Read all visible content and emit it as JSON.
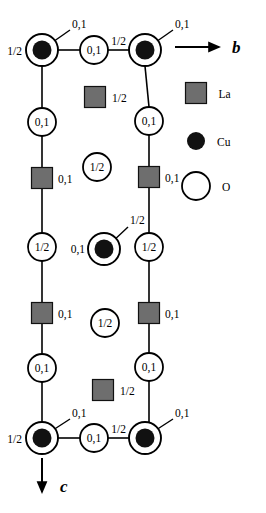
{
  "figure": {
    "colors": {
      "la_fill": "#6e6e6e",
      "cu_fill": "#111111",
      "o_fill": "#ffffff",
      "stroke": "#000000",
      "background": "#ffffff"
    }
  },
  "axes": [
    {
      "name": "b-axis",
      "label": "b",
      "direction": "right",
      "x1": 175,
      "y1": 47,
      "x2": 219,
      "y2": 47,
      "label_x": 232,
      "label_y": 53
    },
    {
      "name": "c-axis",
      "label": "c",
      "direction": "down",
      "x1": 42,
      "y1": 458,
      "x2": 42,
      "y2": 492,
      "label_x": 60,
      "label_y": 492
    }
  ],
  "legend": {
    "items": [
      {
        "symbol": "square",
        "label": "La",
        "x": 196,
        "y": 93,
        "size": 21
      },
      {
        "symbol": "filled-circle",
        "label": "Cu",
        "x": 196,
        "y": 141,
        "r": 9
      },
      {
        "symbol": "open-circle",
        "label": "O",
        "x": 196,
        "y": 186,
        "r": 14
      }
    ]
  },
  "atoms": [
    {
      "id": "cu-tl",
      "type": "Cu",
      "x": 42,
      "y": 50,
      "r_outer": 16,
      "r_dot": 9.5
    },
    {
      "id": "cu-tr",
      "type": "Cu",
      "x": 145,
      "y": 50,
      "r_outer": 16,
      "r_dot": 9.5
    },
    {
      "id": "cu-center",
      "type": "Cu",
      "x": 104,
      "y": 249,
      "r_outer": 16,
      "r_dot": 9.5
    },
    {
      "id": "cu-bl",
      "type": "Cu",
      "x": 42,
      "y": 438,
      "r_outer": 16,
      "r_dot": 9.5
    },
    {
      "id": "cu-br",
      "type": "Cu",
      "x": 145,
      "y": 438,
      "r_outer": 16,
      "r_dot": 9.5
    },
    {
      "id": "o-top-mid",
      "type": "O",
      "x": 94,
      "y": 50,
      "r": 14,
      "label": "0,1"
    },
    {
      "id": "o-bot-mid",
      "type": "O",
      "x": 94,
      "y": 438,
      "r": 14,
      "label": "0,1"
    },
    {
      "id": "o-l-1",
      "type": "O",
      "x": 42,
      "y": 122,
      "r": 14,
      "label": "0,1"
    },
    {
      "id": "o-l-2",
      "type": "O",
      "x": 42,
      "y": 247,
      "r": 14,
      "label": "1/2"
    },
    {
      "id": "o-l-3",
      "type": "O",
      "x": 42,
      "y": 368,
      "r": 14,
      "label": "0,1"
    },
    {
      "id": "o-r-1",
      "type": "O",
      "x": 149,
      "y": 121,
      "r": 14,
      "label": "0,1"
    },
    {
      "id": "o-r-2",
      "type": "O",
      "x": 149,
      "y": 247,
      "r": 14,
      "label": "1/2"
    },
    {
      "id": "o-r-3",
      "type": "O",
      "x": 149,
      "y": 367,
      "r": 14,
      "label": "0,1"
    },
    {
      "id": "o-c-1",
      "type": "O",
      "x": 97,
      "y": 167,
      "r": 14,
      "label": "1/2"
    },
    {
      "id": "o-c-2",
      "type": "O",
      "x": 105,
      "y": 323,
      "r": 14,
      "label": "1/2"
    },
    {
      "id": "la-l-1",
      "type": "La",
      "x": 42,
      "y": 178,
      "size": 21
    },
    {
      "id": "la-l-2",
      "type": "La",
      "x": 42,
      "y": 313,
      "size": 21
    },
    {
      "id": "la-r-1",
      "type": "La",
      "x": 149,
      "y": 177,
      "size": 21
    },
    {
      "id": "la-r-2",
      "type": "La",
      "x": 149,
      "y": 313,
      "size": 21
    },
    {
      "id": "la-c-1",
      "type": "La",
      "x": 95,
      "y": 97,
      "size": 21
    },
    {
      "id": "la-c-2",
      "type": "La",
      "x": 103,
      "y": 390,
      "size": 21
    }
  ],
  "bonds": [
    {
      "x1": 58,
      "y1": 50,
      "x2": 80,
      "y2": 50
    },
    {
      "x1": 108,
      "y1": 50,
      "x2": 129,
      "y2": 50
    },
    {
      "x1": 42,
      "y1": 66,
      "x2": 42,
      "y2": 108
    },
    {
      "x1": 145,
      "y1": 66,
      "x2": 149,
      "y2": 107
    },
    {
      "x1": 42,
      "y1": 136,
      "x2": 42,
      "y2": 168
    },
    {
      "x1": 149,
      "y1": 135,
      "x2": 149,
      "y2": 167
    },
    {
      "x1": 42,
      "y1": 188,
      "x2": 42,
      "y2": 233
    },
    {
      "x1": 149,
      "y1": 187,
      "x2": 149,
      "y2": 233
    },
    {
      "x1": 42,
      "y1": 261,
      "x2": 42,
      "y2": 303
    },
    {
      "x1": 149,
      "y1": 261,
      "x2": 149,
      "y2": 303
    },
    {
      "x1": 42,
      "y1": 323,
      "x2": 42,
      "y2": 354
    },
    {
      "x1": 149,
      "y1": 323,
      "x2": 149,
      "y2": 353
    },
    {
      "x1": 42,
      "y1": 382,
      "x2": 42,
      "y2": 422
    },
    {
      "x1": 149,
      "y1": 381,
      "x2": 149,
      "y2": 422
    },
    {
      "x1": 58,
      "y1": 438,
      "x2": 80,
      "y2": 438
    },
    {
      "x1": 108,
      "y1": 438,
      "x2": 129,
      "y2": 438
    }
  ],
  "leaders": [
    {
      "id": "leader-cu-tl",
      "x1": 50,
      "y1": 44,
      "x2": 70,
      "y2": 30
    },
    {
      "id": "leader-cu-tr",
      "x1": 153,
      "y1": 44,
      "x2": 173,
      "y2": 30
    },
    {
      "id": "leader-cu-center",
      "x1": 111,
      "y1": 243,
      "x2": 128,
      "y2": 227
    },
    {
      "id": "leader-cu-bl",
      "x1": 50,
      "y1": 432,
      "x2": 70,
      "y2": 419
    },
    {
      "id": "leader-cu-br",
      "x1": 153,
      "y1": 432,
      "x2": 173,
      "y2": 419
    }
  ],
  "labels": [
    {
      "id": "lbl-cu-tl-leader",
      "text": "0,1",
      "x": 72,
      "y": 28,
      "anchor": "start"
    },
    {
      "id": "lbl-cu-tl-left",
      "text": "1/2",
      "x": 22,
      "y": 55,
      "anchor": "end"
    },
    {
      "id": "lbl-cu-tr-leader",
      "text": "0,1",
      "x": 175,
      "y": 28,
      "anchor": "start"
    },
    {
      "id": "lbl-cu-tr-left",
      "text": "1/2",
      "x": 126,
      "y": 45,
      "anchor": "end"
    },
    {
      "id": "lbl-la-c-1",
      "text": "1/2",
      "x": 112,
      "y": 102,
      "anchor": "start"
    },
    {
      "id": "lbl-la-l-1",
      "text": "0,1",
      "x": 58,
      "y": 183,
      "anchor": "start"
    },
    {
      "id": "lbl-la-r-1",
      "text": "0,1",
      "x": 165,
      "y": 182,
      "anchor": "start"
    },
    {
      "id": "lbl-cu-center-leader",
      "text": "1/2",
      "x": 130,
      "y": 224,
      "anchor": "start"
    },
    {
      "id": "lbl-cu-center-left",
      "text": "0,1",
      "x": 85,
      "y": 253,
      "anchor": "end"
    },
    {
      "id": "lbl-la-l-2",
      "text": "0,1",
      "x": 58,
      "y": 318,
      "anchor": "start"
    },
    {
      "id": "lbl-la-r-2",
      "text": "0,1",
      "x": 165,
      "y": 318,
      "anchor": "start"
    },
    {
      "id": "lbl-la-c-2",
      "text": "1/2",
      "x": 120,
      "y": 395,
      "anchor": "start"
    },
    {
      "id": "lbl-cu-bl-leader",
      "text": "0,1",
      "x": 72,
      "y": 417,
      "anchor": "start"
    },
    {
      "id": "lbl-cu-bl-left",
      "text": "1/2",
      "x": 22,
      "y": 443,
      "anchor": "end"
    },
    {
      "id": "lbl-cu-br-leader",
      "text": "0,1",
      "x": 175,
      "y": 417,
      "anchor": "start"
    },
    {
      "id": "lbl-cu-br-left",
      "text": "1/2",
      "x": 126,
      "y": 433,
      "anchor": "end"
    }
  ],
  "chart_data": {
    "type": "diagram",
    "axis_labels": [
      "b",
      "c"
    ],
    "species": [
      {
        "name": "La",
        "marker": "gray square",
        "count": 6
      },
      {
        "name": "Cu",
        "marker": "black filled circle inside open circle",
        "count": 5
      },
      {
        "name": "O",
        "marker": "open circle",
        "count": 10
      }
    ],
    "height_labels": [
      "0,1",
      "1/2"
    ]
  }
}
